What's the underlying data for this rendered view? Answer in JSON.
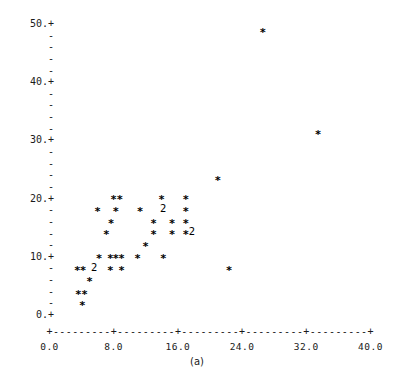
{
  "chart_data": {
    "type": "scatter",
    "title": "",
    "subtitle": "",
    "caption": "(a)",
    "xlabel": "",
    "ylabel": "",
    "xlim": [
      0.0,
      40.0
    ],
    "ylim": [
      0.0,
      50.0
    ],
    "grid": false,
    "legend": null,
    "marker": "*",
    "overlap_marker": "2",
    "overlap_note": "A digit in place of * indicates that many coincident observations",
    "x_ticks": [
      "0.0",
      "8.0",
      "16.0",
      "24.0",
      "32.0",
      "40.0"
    ],
    "x_tick_values": [
      0.0,
      8.0,
      16.0,
      24.0,
      32.0,
      40.0
    ],
    "x_minor_per_interval": 4,
    "y_ticks": [
      "50.+",
      "40.+",
      "30.+",
      "20.+",
      "10.+",
      "0.+"
    ],
    "y_tick_values": [
      50,
      40,
      30,
      20,
      10,
      0
    ],
    "y_minor_per_interval": 4,
    "points": [
      {
        "x": 4.1,
        "y": 2.0,
        "n": 1
      },
      {
        "x": 3.6,
        "y": 4.0,
        "n": 1
      },
      {
        "x": 4.4,
        "y": 4.0,
        "n": 1
      },
      {
        "x": 5.0,
        "y": 6.2,
        "n": 1
      },
      {
        "x": 3.5,
        "y": 8.1,
        "n": 1
      },
      {
        "x": 4.2,
        "y": 8.1,
        "n": 1
      },
      {
        "x": 5.6,
        "y": 8.1,
        "n": 2
      },
      {
        "x": 7.6,
        "y": 8.1,
        "n": 1
      },
      {
        "x": 9.0,
        "y": 8.1,
        "n": 1
      },
      {
        "x": 6.2,
        "y": 10.1,
        "n": 1
      },
      {
        "x": 7.6,
        "y": 10.1,
        "n": 1
      },
      {
        "x": 8.3,
        "y": 10.1,
        "n": 1
      },
      {
        "x": 9.0,
        "y": 10.1,
        "n": 1
      },
      {
        "x": 11.0,
        "y": 10.1,
        "n": 1
      },
      {
        "x": 14.2,
        "y": 10.1,
        "n": 1
      },
      {
        "x": 22.4,
        "y": 8.1,
        "n": 1
      },
      {
        "x": 12.0,
        "y": 12.2,
        "n": 1
      },
      {
        "x": 7.1,
        "y": 14.2,
        "n": 1
      },
      {
        "x": 13.0,
        "y": 14.2,
        "n": 1
      },
      {
        "x": 15.3,
        "y": 14.2,
        "n": 1
      },
      {
        "x": 17.0,
        "y": 14.2,
        "n": 1
      },
      {
        "x": 17.8,
        "y": 14.2,
        "n": 2
      },
      {
        "x": 7.7,
        "y": 16.2,
        "n": 1
      },
      {
        "x": 13.0,
        "y": 16.2,
        "n": 1
      },
      {
        "x": 15.3,
        "y": 16.2,
        "n": 1
      },
      {
        "x": 17.0,
        "y": 16.2,
        "n": 1
      },
      {
        "x": 8.3,
        "y": 18.2,
        "n": 1
      },
      {
        "x": 6.0,
        "y": 18.2,
        "n": 1
      },
      {
        "x": 11.3,
        "y": 18.2,
        "n": 1
      },
      {
        "x": 14.2,
        "y": 18.2,
        "n": 2
      },
      {
        "x": 17.0,
        "y": 18.2,
        "n": 1
      },
      {
        "x": 8.0,
        "y": 20.2,
        "n": 1
      },
      {
        "x": 8.8,
        "y": 20.2,
        "n": 1
      },
      {
        "x": 14.0,
        "y": 20.2,
        "n": 1
      },
      {
        "x": 17.0,
        "y": 20.2,
        "n": 1
      },
      {
        "x": 21.0,
        "y": 23.5,
        "n": 1
      },
      {
        "x": 33.5,
        "y": 31.5,
        "n": 1
      },
      {
        "x": 26.6,
        "y": 49.0,
        "n": 1
      }
    ]
  },
  "axes": {
    "y_label_texts": [
      "50.+",
      "40.+",
      "30.+",
      "20.+",
      "10.+",
      "0.+"
    ],
    "minor_tick_glyph": "-",
    "x_axis_glyph_row": "+---------+---------+---------+---------+---------+",
    "x_tick_labels": [
      "0.0",
      "8.0",
      "16.0",
      "24.0",
      "32.0",
      "40.0"
    ]
  },
  "caption": {
    "text": "(a)"
  }
}
